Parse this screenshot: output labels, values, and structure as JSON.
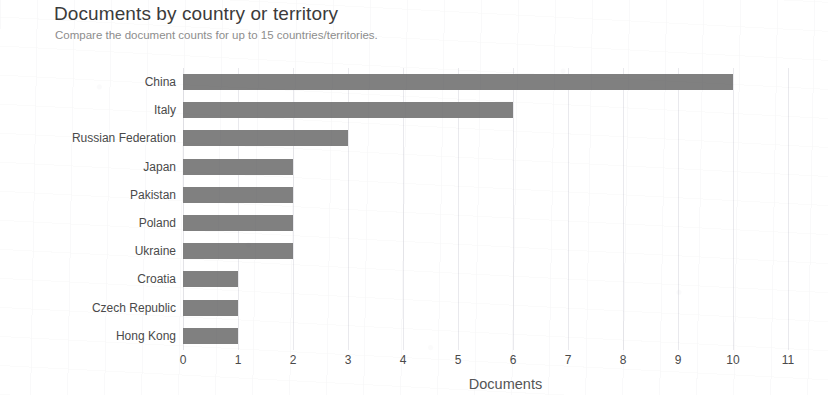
{
  "header": {
    "title": "Documents by country or territory",
    "subtitle": "Compare the document counts for up to 15 countries/territories."
  },
  "colors": {
    "bar": "#808080",
    "grid": "#e9e9ed",
    "title_text": "#3b3b3b",
    "subtitle_text": "#8d8d8d",
    "tick_text": "#4a4a4a",
    "background": "#ffffff"
  },
  "chart_data": {
    "type": "bar",
    "orientation": "horizontal",
    "title": "Documents by country or territory",
    "subtitle": "Compare the document counts for up to 15 countries/territories.",
    "xlabel": "Documents",
    "ylabel": "",
    "categories": [
      "China",
      "Italy",
      "Russian Federation",
      "Japan",
      "Pakistan",
      "Poland",
      "Ukraine",
      "Croatia",
      "Czech Republic",
      "Hong Kong"
    ],
    "values": [
      10,
      6,
      3,
      2,
      2,
      2,
      2,
      1,
      1,
      1
    ],
    "xlim": [
      0,
      11
    ],
    "xticks": [
      0,
      1,
      2,
      3,
      4,
      5,
      6,
      7,
      8,
      9,
      10,
      11
    ],
    "xtick_labels": [
      "0",
      "1",
      "2",
      "3",
      "4",
      "5",
      "6",
      "7",
      "8",
      "9",
      "10",
      "11"
    ],
    "grid": true,
    "grid_axis": "x",
    "legend": false
  }
}
